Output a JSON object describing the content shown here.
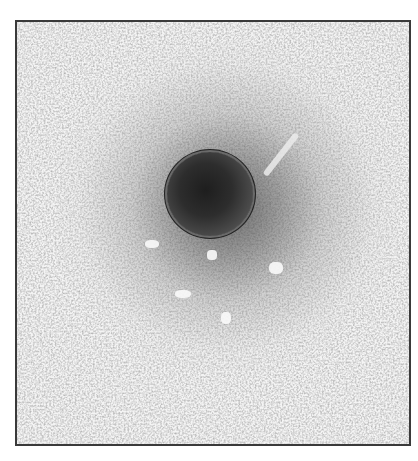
{
  "image": {
    "description": "Negative-stain electron micrograph of a single roughly spherical particle with a dark core and a surrounding halo, on a grainy light background, enclosed in a thin dark frame",
    "colors": {
      "background": "#ffffff",
      "frame_border": "#3a3a3a",
      "field": "#f4f4f4",
      "particle_core": "#1e1e1e",
      "particle_rim": "#222222"
    }
  }
}
